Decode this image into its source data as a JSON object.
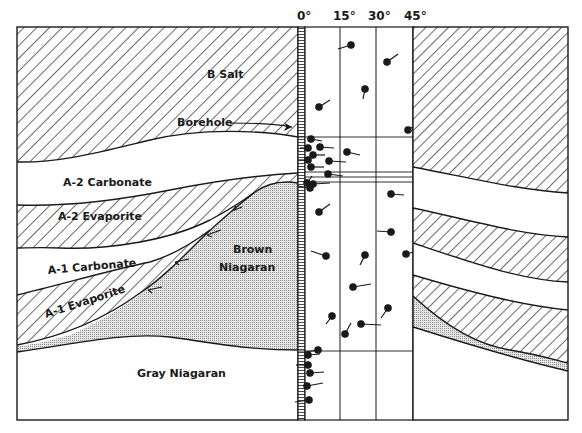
{
  "diagram": {
    "type": "geologic cross-section with dipmeter log",
    "dip_scale": {
      "ticks": [
        "0°",
        "15°",
        "30°",
        "45°"
      ]
    },
    "layers": [
      {
        "id": "b-salt",
        "label": "B Salt",
        "pattern": "diagonal-hatch"
      },
      {
        "id": "a2-carbonate",
        "label": "A-2 Carbonate",
        "pattern": "blank"
      },
      {
        "id": "a2-evaporite",
        "label": "A-2 Evaporite",
        "pattern": "diagonal-hatch"
      },
      {
        "id": "a1-carbonate",
        "label": "A-1 Carbonate",
        "pattern": "blank"
      },
      {
        "id": "a1-evaporite",
        "label": "A-1 Evaporite",
        "pattern": "diagonal-hatch"
      },
      {
        "id": "brown-niagaran",
        "label": "Brown Niagaran",
        "label_line1": "Brown",
        "label_line2": "Niagaran",
        "pattern": "stipple"
      },
      {
        "id": "gray-niagaran",
        "label": "Gray Niagaran",
        "pattern": "blank"
      }
    ],
    "annotations": {
      "borehole": "Borehole"
    },
    "colors": {
      "ink": "#1a1a1a",
      "paper": "#ffffff",
      "stipple": "#bdbdbd"
    }
  }
}
